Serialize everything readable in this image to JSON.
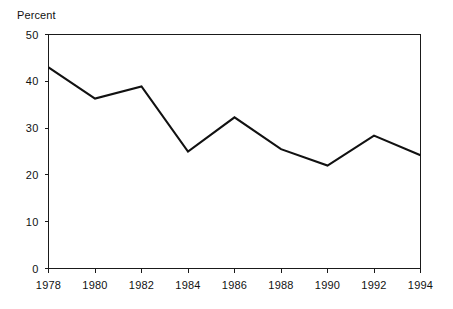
{
  "chart_data": {
    "type": "line",
    "title": "",
    "xlabel": "",
    "ylabel": "Percent",
    "ylim": [
      0,
      50
    ],
    "xlim": [
      1978,
      1994
    ],
    "grid": false,
    "legend": "none",
    "y_ticks": [
      "0",
      "10",
      "20",
      "30",
      "40",
      "50"
    ],
    "y_tick_values": [
      0,
      10,
      20,
      30,
      40,
      50
    ],
    "x_ticks": [
      "1978",
      "1980",
      "1982",
      "1984",
      "1986",
      "1988",
      "1990",
      "1992",
      "1994"
    ],
    "x": [
      1978,
      1980,
      1982,
      1984,
      1986,
      1988,
      1990,
      1992,
      1994
    ],
    "values": [
      43.0,
      36.3,
      38.9,
      25.0,
      32.3,
      25.5,
      22.0,
      28.4,
      24.2
    ],
    "series": [
      {
        "name": "Percent",
        "color": "#111111",
        "values": [
          43.0,
          36.3,
          38.9,
          25.0,
          32.3,
          25.5,
          22.0,
          28.4,
          24.2
        ]
      }
    ]
  },
  "colors": {
    "line": "#111111",
    "axis": "#1a1a1a",
    "background": "#ffffff",
    "text": "#111111"
  }
}
